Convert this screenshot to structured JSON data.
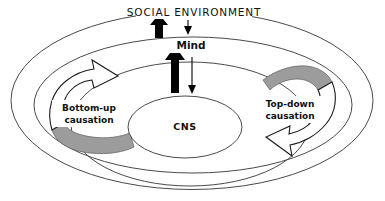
{
  "diagram": {
    "title": "SOCIAL ENVIRONMENT",
    "type": "nested-ellipse-causation-diagram",
    "colors": {
      "background": "#ffffff",
      "outline": "#4a4a4a",
      "arrow_gray_fill": "#9c9c9c",
      "arrow_open_fill": "#ffffff",
      "arrow_solid_fill": "#000000",
      "text": "#111111"
    },
    "levels": [
      {
        "name": "social-environment",
        "label": "SOCIAL ENVIRONMENT",
        "ring": "outer"
      },
      {
        "name": "mind",
        "label": "Mind",
        "ring": "middle"
      },
      {
        "name": "cns",
        "label": "CNS",
        "ring": "inner"
      }
    ],
    "arrows": {
      "bottom_up": {
        "label_line1": "Bottom-up",
        "label_line2": "causation",
        "style": "open-block-arrow-with-gray-tail",
        "direction": "counter-clockwise-upward"
      },
      "top_down": {
        "label_line1": "Top-down",
        "label_line2": "causation",
        "style": "open-block-arrow-with-gray-tail",
        "direction": "clockwise-downward"
      },
      "cns_to_mind": {
        "style": "solid-thick-up-arrow",
        "direction": "up"
      },
      "mind_to_cns": {
        "style": "thin-down-arrow",
        "direction": "down"
      },
      "mind_to_social": {
        "style": "solid-thick-up-arrow",
        "direction": "up"
      },
      "social_to_mind": {
        "style": "thin-down-arrow",
        "direction": "down"
      }
    }
  }
}
